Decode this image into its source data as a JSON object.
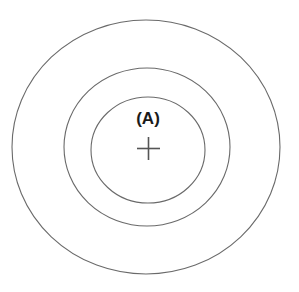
{
  "canvas": {
    "width": 299,
    "height": 292,
    "background_color": "#ffffff"
  },
  "diagram": {
    "title": "",
    "type": "concentric-circles",
    "stroke_color": "#666666",
    "stroke_width": 1.1,
    "label_color": "#1a1a1a"
  },
  "rings": [
    {
      "id": "outer-ring",
      "name": "outer-ring",
      "cx": 146,
      "cy": 147,
      "rx": 134,
      "ry": 127,
      "stroke": "#6a6a6a",
      "stroke_width": 1.1
    },
    {
      "id": "middle-ring",
      "name": "middle-ring",
      "cx": 147,
      "cy": 147,
      "rx": 83,
      "ry": 79,
      "stroke": "#6a6a6a",
      "stroke_width": 1.1
    },
    {
      "id": "inner-ring",
      "name": "inner-ring",
      "cx": 148,
      "cy": 150,
      "rx": 57,
      "ry": 53,
      "stroke": "#6a6a6a",
      "stroke_width": 1.1
    }
  ],
  "center_marker": {
    "name": "center-crosshair",
    "cx": 148.5,
    "cy": 148.5,
    "arm_length": 11.5,
    "stroke": "#555555",
    "stroke_width": 1.6
  },
  "labels": {
    "zone_a": {
      "text": "(A)",
      "x": 148,
      "y": 124,
      "font_size": 17,
      "font_weight": "bold",
      "color": "#1a1a1a"
    }
  }
}
